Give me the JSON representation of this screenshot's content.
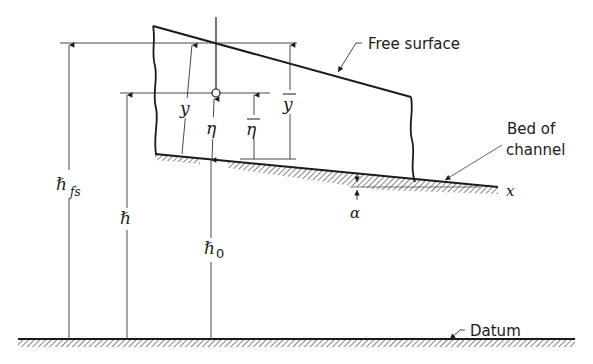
{
  "figure": {
    "type": "open-channel flow definition sketch",
    "labels": {
      "free_surface": "Free surface",
      "bed_of_channel_line1": "Bed of",
      "bed_of_channel_line2": "channel",
      "datum": "Datum",
      "x_axis": "x",
      "alpha": "α",
      "y": "y",
      "y_bar": "y",
      "eta": "η",
      "eta_bar": "η",
      "h_fs_main": "ℏ",
      "h_fs_sub": "fs",
      "h": "ℏ",
      "h0_main": "ℏ",
      "h0_sub": "0"
    },
    "colors": {
      "ink": "#1a1a1a",
      "thin_line": "#333333",
      "leader": "#555555",
      "background": "#ffffff"
    }
  }
}
